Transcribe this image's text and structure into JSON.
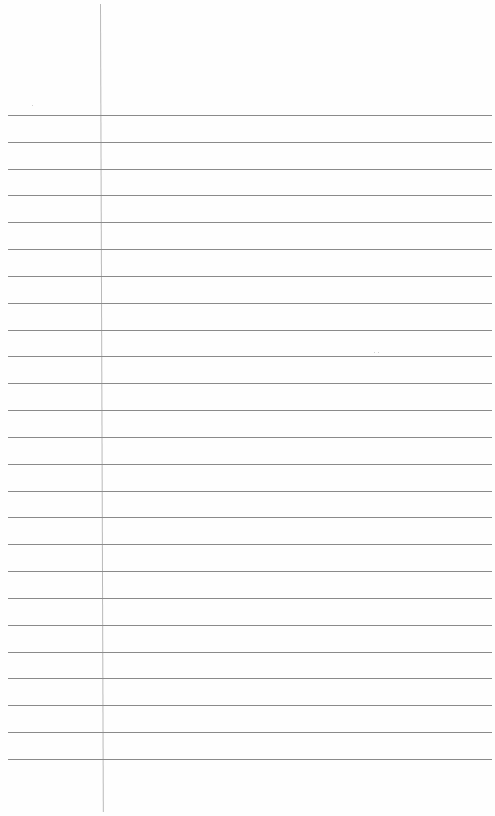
{
  "document": {
    "type": "lined-paper",
    "background": "#fefefe",
    "rule_color": "#8a8a8a",
    "margin_color": "#b9b9b9",
    "margin_x": 100,
    "first_rule_y": 115,
    "rule_spacing": 26.83,
    "rule_count": 25,
    "text": ""
  }
}
